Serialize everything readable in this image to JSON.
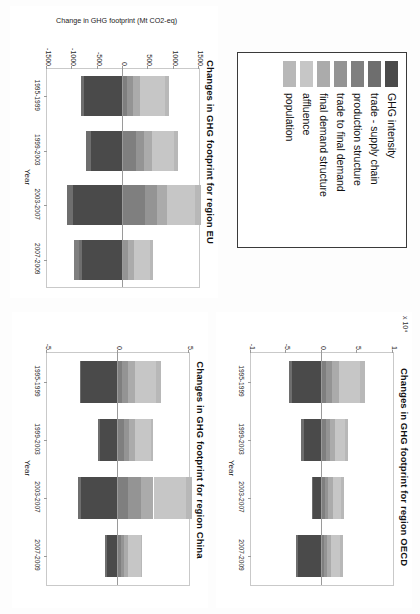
{
  "figure": {
    "legend": {
      "entries": [
        {
          "label": "GHG intensity",
          "color": "#4a4a4a"
        },
        {
          "label": "trade - supply chain",
          "color": "#6e6e6e"
        },
        {
          "label": "production structure",
          "color": "#7f7f7f"
        },
        {
          "label": "trade to final demand",
          "color": "#949494"
        },
        {
          "label": "final demand structure",
          "color": "#ababab"
        },
        {
          "label": "affluence",
          "color": "#c6c6c6"
        },
        {
          "label": "population",
          "color": "#b8b8b8"
        }
      ]
    }
  },
  "chart_data": [
    {
      "type": "bar",
      "stacked": true,
      "title": "Changes in GHG footprint for region EU",
      "xlabel": "Year",
      "ylabel": "Change in GHG footprint (Mt CO2-eq)",
      "multiplier": "",
      "categories": [
        "1995-1999",
        "1999-2003",
        "2003-2007",
        "2007-2009"
      ],
      "yticks": [
        1500,
        1000,
        500,
        0,
        -500,
        -1000,
        -1500
      ],
      "ytick_labels": [
        "1500",
        "1000",
        "500",
        "0",
        "-500",
        "-1000",
        "-1500"
      ],
      "ylim": [
        -1500,
        1500
      ],
      "grid": false,
      "legend_position": "separate-box",
      "series": [
        {
          "name": "GHG intensity",
          "values": [
            -760,
            -640,
            -980,
            -800
          ]
        },
        {
          "name": "trade - supply chain",
          "values": [
            -70,
            -90,
            -130,
            -60
          ]
        },
        {
          "name": "production structure",
          "values": [
            70,
            260,
            430,
            -110
          ]
        },
        {
          "name": "trade to final demand",
          "values": [
            120,
            150,
            240,
            90
          ]
        },
        {
          "name": "final demand structure",
          "values": [
            150,
            170,
            190,
            120
          ]
        },
        {
          "name": "affluence",
          "values": [
            480,
            420,
            560,
            330
          ]
        },
        {
          "name": "population",
          "values": [
            90,
            80,
            110,
            60
          ]
        }
      ]
    },
    {
      "type": "bar",
      "stacked": true,
      "title": "Changes in GHG footprint for region China",
      "xlabel": "Year",
      "ylabel": "",
      "multiplier": "",
      "categories": [
        "1995-1999",
        "1999-2003",
        "2003-2007",
        "2007-2009"
      ],
      "yticks": [
        5,
        0,
        -5
      ],
      "ytick_labels": [
        "5",
        "0",
        "-5"
      ],
      "ylim": [
        -5,
        5
      ],
      "grid": false,
      "legend_position": "separate-box",
      "series": [
        {
          "name": "GHG intensity",
          "values": [
            -2.6,
            -1.3,
            -2.6,
            -0.8
          ]
        },
        {
          "name": "trade - supply chain",
          "values": [
            -0.1,
            -0.1,
            -0.2,
            -0.1
          ]
        },
        {
          "name": "production structure",
          "values": [
            0.3,
            0.4,
            0.7,
            0.2
          ]
        },
        {
          "name": "trade to final demand",
          "values": [
            0.4,
            0.4,
            0.9,
            0.2
          ]
        },
        {
          "name": "final demand structure",
          "values": [
            0.5,
            0.4,
            0.9,
            0.3
          ]
        },
        {
          "name": "affluence",
          "values": [
            1.5,
            1.1,
            2.3,
            0.9
          ]
        },
        {
          "name": "population",
          "values": [
            0.3,
            0.2,
            0.4,
            0.1
          ]
        }
      ]
    },
    {
      "type": "bar",
      "stacked": true,
      "title": "Changes in GHG footprint for region OECD",
      "xlabel": "Year",
      "ylabel": "",
      "multiplier": "x 10⁴",
      "categories": [
        "1995-1999",
        "1999-2003",
        "2003-2007",
        "2007-2009"
      ],
      "yticks": [
        1,
        5,
        0,
        -5,
        -1
      ],
      "ytick_labels": [
        "1",
        "5",
        "0",
        "-5",
        "-1"
      ],
      "ylim": [
        -1,
        1
      ],
      "grid": false,
      "legend_position": "separate-box",
      "series": [
        {
          "name": "GHG intensity",
          "values": [
            -0.42,
            -0.26,
            -0.12,
            -0.34
          ]
        },
        {
          "name": "trade - supply chain",
          "values": [
            -0.04,
            -0.03,
            -0.02,
            -0.03
          ]
        },
        {
          "name": "production structure",
          "values": [
            0.06,
            0.05,
            0.04,
            0.03
          ]
        },
        {
          "name": "trade to final demand",
          "values": [
            0.08,
            0.06,
            0.05,
            0.04
          ]
        },
        {
          "name": "final demand structure",
          "values": [
            0.1,
            0.07,
            0.06,
            0.05
          ]
        },
        {
          "name": "affluence",
          "values": [
            0.3,
            0.14,
            0.12,
            0.14
          ]
        },
        {
          "name": "population",
          "values": [
            0.06,
            0.04,
            0.04,
            0.03
          ]
        }
      ]
    }
  ]
}
